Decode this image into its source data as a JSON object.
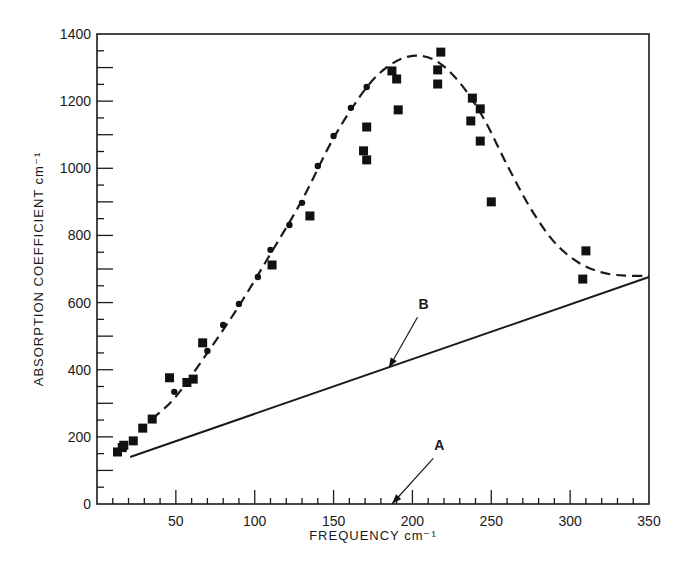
{
  "chart_data": {
    "type": "scatter",
    "title": "",
    "xlabel": "FREQUENCY cm⁻¹",
    "ylabel": "ABSORPTION COEFFICIENT cm⁻¹",
    "xlim": [
      0,
      350
    ],
    "ylim": [
      0,
      1400
    ],
    "grid": false,
    "legend": null,
    "x_ticks": [
      {
        "value": 50,
        "label": "50"
      },
      {
        "value": 100,
        "label": "100"
      },
      {
        "value": 150,
        "label": "150"
      },
      {
        "value": 200,
        "label": "200"
      },
      {
        "value": 250,
        "label": "250"
      },
      {
        "value": 300,
        "label": "300"
      },
      {
        "value": 350,
        "label": "350"
      }
    ],
    "y_ticks": [
      {
        "value": 0,
        "label": "0"
      },
      {
        "value": 200,
        "label": "200"
      },
      {
        "value": 400,
        "label": "400"
      },
      {
        "value": 600,
        "label": "600"
      },
      {
        "value": 800,
        "label": "800"
      },
      {
        "value": 1000,
        "label": "1000"
      },
      {
        "value": 1200,
        "label": "1200"
      },
      {
        "value": 1400,
        "label": "1400"
      }
    ],
    "series": [
      {
        "name": "measured (squares)",
        "marker": "square",
        "points": [
          [
            13,
            155
          ],
          [
            16,
            168
          ],
          [
            17,
            175
          ],
          [
            23,
            188
          ],
          [
            29,
            226
          ],
          [
            35,
            253
          ],
          [
            46,
            376
          ],
          [
            57,
            362
          ],
          [
            61,
            372
          ],
          [
            67,
            480
          ],
          [
            111,
            712
          ],
          [
            135,
            858
          ],
          [
            169,
            1052
          ],
          [
            171,
            1025
          ],
          [
            171,
            1123
          ],
          [
            187,
            1290
          ],
          [
            190,
            1266
          ],
          [
            191,
            1174
          ],
          [
            216,
            1293
          ],
          [
            216,
            1251
          ],
          [
            218,
            1346
          ],
          [
            237,
            1141
          ],
          [
            238,
            1209
          ],
          [
            243,
            1177
          ],
          [
            243,
            1081
          ],
          [
            250,
            900
          ],
          [
            308,
            670
          ],
          [
            310,
            754
          ]
        ]
      },
      {
        "name": "measured (dots)",
        "marker": "circle",
        "points": [
          [
            49,
            334
          ],
          [
            70,
            456
          ],
          [
            80,
            533
          ],
          [
            90,
            596
          ],
          [
            102,
            676
          ],
          [
            110,
            757
          ],
          [
            122,
            831
          ],
          [
            130,
            897
          ],
          [
            140,
            1007
          ],
          [
            150,
            1096
          ],
          [
            161,
            1180
          ],
          [
            171,
            1242
          ]
        ]
      },
      {
        "name": "dashed fit curve",
        "style": "dashed",
        "points": [
          [
            35,
            253
          ],
          [
            50,
            320
          ],
          [
            70,
            450
          ],
          [
            90,
            590
          ],
          [
            110,
            745
          ],
          [
            130,
            905
          ],
          [
            150,
            1090
          ],
          [
            170,
            1235
          ],
          [
            185,
            1305
          ],
          [
            200,
            1335
          ],
          [
            215,
            1320
          ],
          [
            230,
            1255
          ],
          [
            245,
            1150
          ],
          [
            260,
            1010
          ],
          [
            275,
            880
          ],
          [
            290,
            780
          ],
          [
            305,
            720
          ],
          [
            320,
            690
          ],
          [
            335,
            680
          ],
          [
            350,
            680
          ]
        ]
      },
      {
        "name": "B",
        "style": "solid",
        "points": [
          [
            21,
            140
          ],
          [
            350,
            676
          ]
        ]
      }
    ],
    "annotations": [
      {
        "label": "B",
        "arrow_to": [
          185,
          405
        ],
        "text_at": [
          207,
          580
        ]
      },
      {
        "label": "A",
        "arrow_to": [
          187,
          0
        ],
        "text_at": [
          217,
          160
        ]
      }
    ]
  }
}
